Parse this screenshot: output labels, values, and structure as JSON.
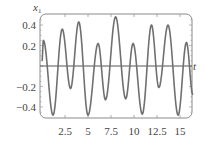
{
  "chart_data": {
    "type": "line",
    "title": "",
    "xlabel": "t",
    "ylabel": "x1",
    "ylabel_main": "x",
    "ylabel_sub": "1",
    "xlim": [
      0,
      16.5
    ],
    "ylim": [
      -0.5,
      0.5
    ],
    "x_ticks": [
      2.5,
      5,
      7.5,
      10,
      12.5,
      15
    ],
    "x_tick_labels": [
      "2.5",
      "5",
      "7.5",
      "10",
      "12.5",
      "15"
    ],
    "y_ticks": [
      0.4,
      0.2,
      -0.2,
      -0.4
    ],
    "y_tick_labels": [
      "0.4",
      "0.2",
      "−0.2",
      "−0.4"
    ],
    "grid": false,
    "legend": null,
    "series": [
      {
        "name": "x1(t)",
        "color": "#707070",
        "points": [
          [
            0.0,
            0.05
          ],
          [
            0.15,
            0.25
          ],
          [
            1.2,
            -0.48
          ],
          [
            2.2,
            0.36
          ],
          [
            3.1,
            -0.22
          ],
          [
            4.0,
            0.43
          ],
          [
            5.0,
            -0.48
          ],
          [
            6.1,
            0.22
          ],
          [
            6.9,
            -0.33
          ],
          [
            8.0,
            0.48
          ],
          [
            9.1,
            -0.32
          ],
          [
            9.9,
            0.22
          ],
          [
            10.9,
            -0.47
          ],
          [
            11.9,
            0.4
          ],
          [
            12.7,
            -0.21
          ],
          [
            13.7,
            0.4
          ],
          [
            14.8,
            -0.48
          ],
          [
            15.7,
            0.23
          ],
          [
            16.4,
            -0.28
          ]
        ]
      }
    ]
  },
  "colors": {
    "frame": "#8a8a8a",
    "axis": "#555555",
    "curve": "#707070",
    "text": "#444444"
  }
}
